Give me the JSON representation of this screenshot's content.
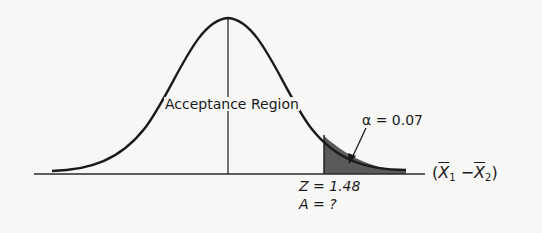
{
  "diagram": {
    "type": "normal-distribution-hypothesis-test",
    "labels": {
      "region": "Acceptance Region",
      "alpha": "α = 0.07",
      "z_value": "Z = 1.48",
      "area": "A = ?",
      "axis": {
        "open": "(",
        "var1": "X",
        "sub1": "1",
        "minus": " −",
        "var2": "X",
        "sub2": "2",
        "close": ")"
      }
    },
    "values": {
      "alpha": 0.07,
      "z_critical": 1.48,
      "tail": "right"
    },
    "colors": {
      "curve": "#1a1a1a",
      "shade": "#555555",
      "background": "#f7f7f5"
    }
  }
}
